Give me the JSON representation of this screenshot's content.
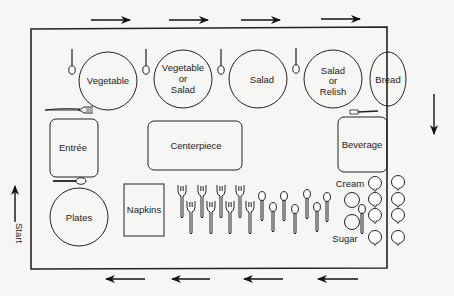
{
  "diagram": {
    "start_label": "Start",
    "items": {
      "vegetable": "Vegetable",
      "veg_or_salad": [
        "Vegetable",
        "or",
        "Salad"
      ],
      "salad": "Salad",
      "salad_or_relish": [
        "Salad",
        "or",
        "Relish"
      ],
      "bread": "Bread",
      "entree": "Entrée",
      "centerpiece": "Centerpiece",
      "beverage": "Beverage",
      "plates": "Plates",
      "napkins": "Napkins",
      "cream": "Cream",
      "sugar": "Sugar"
    },
    "flow_direction": [
      "up (left side)",
      "right (top)",
      "down (right side)",
      "left (bottom)"
    ],
    "arrows": {
      "top_count": 4,
      "right_count": 1,
      "bottom_count": 4,
      "left_count": 1
    },
    "utensils": {
      "forks_in_group": 8,
      "spoons_in_group": 8,
      "cups_columns": 2,
      "cups_per_column": 4
    },
    "colors": {
      "line": "#222222",
      "background": "#f6f6f4"
    }
  }
}
